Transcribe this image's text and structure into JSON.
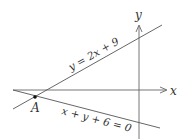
{
  "diagram": {
    "axes": {
      "x_label": "x",
      "y_label": "y"
    },
    "lines": [
      {
        "id": "line-1",
        "equation": "y = 2x + 9"
      },
      {
        "id": "line-2",
        "equation": "x + y + 6 = 0"
      }
    ],
    "points": [
      {
        "id": "A",
        "label": "A",
        "description": "intersection of the two lines"
      }
    ],
    "colors": {
      "stroke": "#555555",
      "text": "#333333",
      "background": "#ffffff"
    }
  }
}
